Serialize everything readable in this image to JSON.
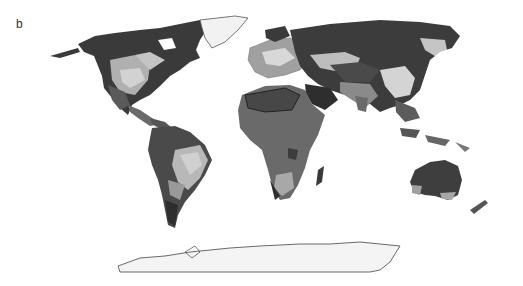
{
  "figure": {
    "panel_label": "b",
    "type": "world map (grayscale classification)",
    "colors": {
      "darkest": "#2e2e2e",
      "dark": "#4a4a4a",
      "mid_dark": "#5e5e5e",
      "mid": "#7a7a7a",
      "light": "#a8a8a8",
      "lighter": "#c8c8c8",
      "ice": "#f2f2f2",
      "outline": "#555555"
    },
    "regions": [
      {
        "name": "North America"
      },
      {
        "name": "Greenland"
      },
      {
        "name": "South America"
      },
      {
        "name": "Europe"
      },
      {
        "name": "Africa"
      },
      {
        "name": "Asia"
      },
      {
        "name": "Australia"
      },
      {
        "name": "Antarctica"
      }
    ]
  }
}
